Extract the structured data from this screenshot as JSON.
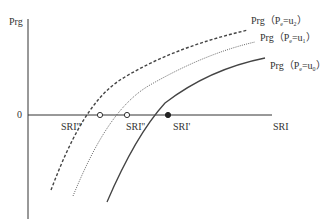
{
  "diagram": {
    "axes": {
      "y_label": "Prg",
      "x_label": "SRI",
      "origin_label": "0"
    },
    "curves": [
      {
        "id": "u2",
        "label_main": "Prg",
        "label_paren_open": "（",
        "label_var": "P",
        "label_sub": "e",
        "label_eq": "=u",
        "label_val_sub": "2",
        "label_paren_close": "）",
        "style": "dashed",
        "intercept_label": "SRI'''"
      },
      {
        "id": "u1",
        "label_main": "Prg",
        "label_paren_open": "（",
        "label_var": "P",
        "label_sub": "e",
        "label_eq": "=u",
        "label_val_sub": "1",
        "label_paren_close": "）",
        "style": "dotted",
        "intercept_label": "SRI''"
      },
      {
        "id": "u0",
        "label_main": "Prg",
        "label_paren_open": "（",
        "label_var": "P",
        "label_sub": "e",
        "label_eq": "=u",
        "label_val_sub": "0",
        "label_paren_close": "）",
        "style": "solid",
        "intercept_label": "SRI'"
      }
    ],
    "colors": {
      "axis": "#333333",
      "curve": "#444444",
      "text": "#333333"
    }
  }
}
